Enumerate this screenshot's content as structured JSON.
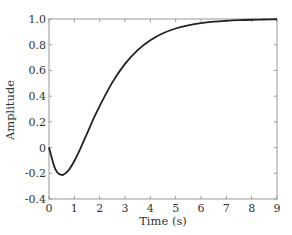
{
  "chart_data": {
    "type": "line",
    "title": "",
    "xlabel": "Time (s)",
    "ylabel": "Amplitude",
    "xlim": [
      0,
      9
    ],
    "ylim": [
      -0.4,
      1.0
    ],
    "xticks": [
      0,
      1,
      2,
      3,
      4,
      5,
      6,
      7,
      8,
      9
    ],
    "xtick_labels": [
      "0",
      "1",
      "2",
      "3",
      "4",
      "5",
      "6",
      "7",
      "8",
      "9"
    ],
    "yticks": [
      -0.4,
      -0.2,
      0,
      0.2,
      0.4,
      0.6,
      0.8,
      1.0
    ],
    "ytick_labels": [
      "-0.4",
      "-0.2",
      "0",
      "0.2",
      "0.4",
      "0.6",
      "0.8",
      "1.0"
    ],
    "grid": false,
    "legend": null,
    "series": [
      {
        "name": "step response",
        "color": "#222222",
        "x": [
          0,
          0.25,
          0.5,
          0.75,
          1.0,
          1.25,
          1.5,
          1.75,
          2.0,
          2.5,
          3.0,
          3.5,
          4.0,
          4.5,
          5.0,
          5.5,
          6.0,
          6.5,
          7.0,
          7.5,
          8.0,
          8.5,
          9.0
        ],
        "y": [
          0,
          -0.168,
          -0.213,
          -0.181,
          -0.104,
          -0.003,
          0.108,
          0.221,
          0.323,
          0.507,
          0.651,
          0.758,
          0.835,
          0.889,
          0.926,
          0.951,
          0.968,
          0.979,
          0.986,
          0.991,
          0.994,
          0.996,
          0.998
        ]
      }
    ]
  },
  "colors": {
    "axis": "#999999",
    "text": "#333333",
    "line": "#222222"
  }
}
